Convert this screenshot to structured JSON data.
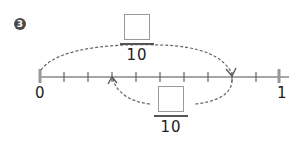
{
  "problem": {
    "number": "3",
    "badge_icon": "circled-number-3"
  },
  "number_line": {
    "start_label": "0",
    "end_label": "1",
    "divisions": 10,
    "line_color": "#8a8a8a",
    "tick_color": "#666666",
    "end_mark_color": "#999999"
  },
  "jumps": [
    {
      "name": "top-jump",
      "from_tick": 0,
      "to_tick": 8,
      "position": "above",
      "fraction": {
        "numerator": "",
        "denominator": "10"
      }
    },
    {
      "name": "bottom-jump",
      "from_tick": 8,
      "to_tick": 3,
      "position": "below",
      "fraction": {
        "numerator": "",
        "denominator": "10"
      }
    }
  ],
  "colors": {
    "arc": "#666666",
    "text": "#222222",
    "box_border": "#9a9a9a"
  }
}
